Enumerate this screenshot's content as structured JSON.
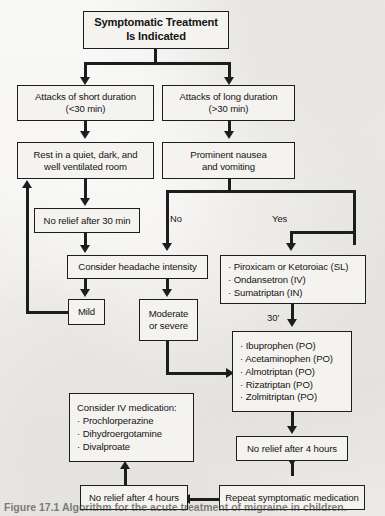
{
  "figure": {
    "type": "clinical-flowchart",
    "title": "Symptomatic Treatment Is Indicated",
    "caption": "Figure 17.1  Algorithm for the acute treatment of migraine in children."
  },
  "nodes": {
    "start": {
      "line1": "Symptomatic Treatment",
      "line2": "Is Indicated"
    },
    "short_duration": {
      "line1": "Attacks of short duration",
      "line2": "(<30 min)"
    },
    "long_duration": {
      "line1": "Attacks of long duration",
      "line2": "(>30 min)"
    },
    "rest": {
      "line1": "Rest in a quiet, dark, and",
      "line2": "well ventilated room"
    },
    "nausea": {
      "line1": "Prominent nausea",
      "line2": "and vomiting"
    },
    "no_relief_30": {
      "line1": "No relief after 30 min"
    },
    "consider_intensity": {
      "line1": "Consider headache intensity"
    },
    "mild": {
      "line1": "Mild"
    },
    "moderate": {
      "line1": "Moderate",
      "line2": "or severe"
    },
    "antiemetic_meds": {
      "items": [
        "· Piroxicam or Ketoroiac (SL)",
        "· Ondansetron (IV)",
        "· Sumatriptan (IN)"
      ]
    },
    "oral_meds": {
      "items": [
        "· Ibuprophen (PO)",
        "· Acetaminophen (PO)",
        "· Almotriptan (PO)",
        "· Rizatriptan (PO)",
        "· Zolmitriptan (PO)"
      ]
    },
    "no_relief_4h_right": {
      "line1": "No relief after 4 hours"
    },
    "repeat": {
      "line1": "Repeat symptomatic medication"
    },
    "no_relief_4h_left": {
      "line1": "No relief after 4 hours"
    },
    "iv_meds": {
      "items": [
        "Consider IV medication:",
        "· Prochlorperazine",
        "· Dihydroergotamine",
        "· Divalproate"
      ]
    }
  },
  "edge_labels": {
    "no": "No",
    "yes": "Yes",
    "thirty_min": "30'"
  },
  "colors": {
    "ink": "#1d1d1d",
    "box_fill": "#f4f3f0",
    "paper": "#efefec"
  }
}
